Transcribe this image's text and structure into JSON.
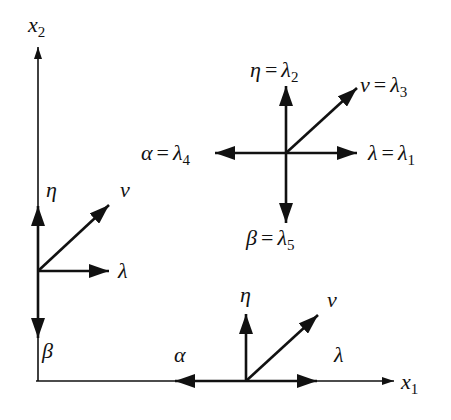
{
  "diagram": {
    "axes": {
      "x1": {
        "symbol": "x",
        "subscript": "1"
      },
      "x2": {
        "symbol": "x",
        "subscript": "2"
      }
    },
    "top_cluster": {
      "eta": {
        "greek": "η",
        "eq": "=",
        "lam": "λ",
        "sub": "2"
      },
      "nu": {
        "greek": "ν",
        "eq": "=",
        "lam": "λ",
        "sub": "3"
      },
      "alpha": {
        "greek": "α",
        "eq": "=",
        "lam": "λ",
        "sub": "4"
      },
      "lambda": {
        "greek": "λ",
        "eq": "=",
        "lam": "λ",
        "sub": "1"
      },
      "beta": {
        "greek": "β",
        "eq": "=",
        "lam": "λ",
        "sub": "5"
      }
    },
    "left_cluster": {
      "eta": "η",
      "nu": "ν",
      "lambda": "λ",
      "beta": "β"
    },
    "bottom_cluster": {
      "eta": "η",
      "nu": "ν",
      "alpha": "α",
      "lambda": "λ"
    },
    "colors": {
      "stroke": "#111111",
      "background": "#ffffff"
    }
  }
}
